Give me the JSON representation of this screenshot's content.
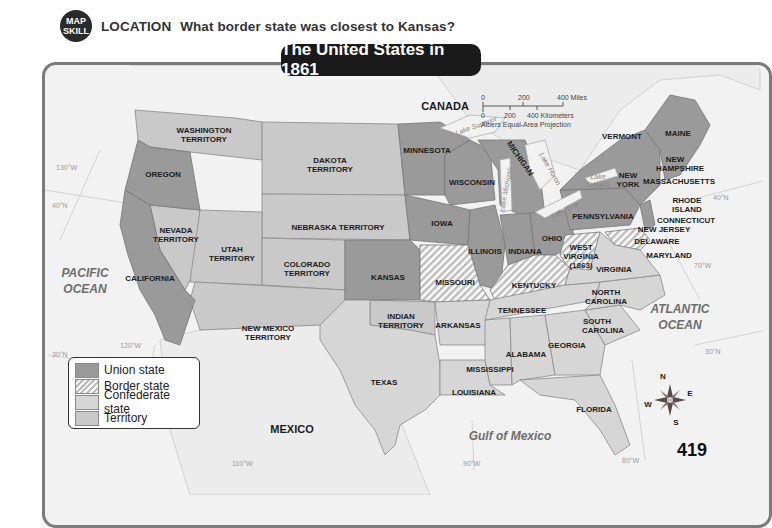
{
  "header": {
    "badge_line1": "MAP",
    "badge_line2": "SKILL",
    "question_keyword": "LOCATION",
    "question_text": "What border state was closest to Kansas?"
  },
  "map": {
    "title": "The United States in 1861",
    "countries": {
      "canada": "CANADA",
      "mexico": "MEXICO"
    },
    "oceans": {
      "pacific_1": "PACIFIC",
      "pacific_2": "OCEAN",
      "atlantic_1": "ATLANTIC",
      "atlantic_2": "OCEAN",
      "gulf": "Gulf of Mexico"
    },
    "lakes": {
      "superior": "Lake Superior",
      "michigan": "Lake Michigan",
      "huron": "Lake Huron",
      "erie": "Lake Erie",
      "ontario_1": "Lake",
      "ontario_2": "Ontario"
    },
    "gridlines": {
      "lon130": "130°W",
      "lon120a": "120°W",
      "lon110": "110°W",
      "lon90": "90°W",
      "lon80": "80°W",
      "lon70": "70°W",
      "lat40w": "40°N",
      "lat30w": "30°N",
      "lat40e": "40°N",
      "lat30e": "30°N"
    },
    "regions": {
      "union": [
        "OREGON",
        "CALIFORNIA",
        "MINNESOTA",
        "WISCONSIN",
        "IOWA",
        "MICHIGAN",
        "ILLINOIS",
        "INDIANA",
        "OHIO",
        "KANSAS",
        "PENNSYLVANIA",
        "NEW YORK",
        "VERMONT",
        "MAINE",
        "NEW HAMPSHIRE",
        "MASSACHUSETTS",
        "RHODE ISLAND",
        "CONNECTICUT",
        "NEW JERSEY",
        "WEST VIRGINIA (1863)"
      ],
      "border": [
        "MISSOURI",
        "KENTUCKY",
        "MARYLAND",
        "DELAWARE"
      ],
      "confederate": [
        "TEXAS",
        "ARKANSAS",
        "LOUISIANA",
        "MISSISSIPPI",
        "ALABAMA",
        "TENNESSEE",
        "GEORGIA",
        "FLORIDA",
        "SOUTH CAROLINA",
        "NORTH CAROLINA",
        "VIRGINIA"
      ],
      "territory": [
        "WASHINGTON TERRITORY",
        "DAKOTA TERRITORY",
        "NEBRASKA TERRITORY",
        "NEVADA TERRITORY",
        "UTAH TERRITORY",
        "COLORADO TERRITORY",
        "NEW MEXICO TERRITORY",
        "INDIAN TERRITORY"
      ]
    },
    "labels": {
      "washington_1": "WASHINGTON",
      "washington_2": "TERRITORY",
      "oregon": "OREGON",
      "dakota_1": "DAKOTA",
      "dakota_2": "TERRITORY",
      "minnesota": "MINNESOTA",
      "wisconsin": "WISCONSIN",
      "michigan": "MICHIGAN",
      "iowa": "IOWA",
      "nebraska": "NEBRASKA TERRITORY",
      "nevada_1": "NEVADA",
      "nevada_2": "TERRITORY",
      "utah_1": "UTAH",
      "utah_2": "TERRITORY",
      "colorado_1": "COLORADO",
      "colorado_2": "TERRITORY",
      "california": "CALIFORNIA",
      "kansas": "KANSAS",
      "missouri": "MISSOURI",
      "illinois": "ILLINOIS",
      "indiana": "INDIANA",
      "ohio": "OHIO",
      "kentucky": "KENTUCKY",
      "westvirginia_1": "WEST",
      "westvirginia_2": "VIRGINIA",
      "westvirginia_3": "(1863)",
      "virginia": "VIRGINIA",
      "pennsylvania": "PENNSYLVANIA",
      "newyork_1": "NEW",
      "newyork_2": "YORK",
      "vermont": "VERMONT",
      "maine": "MAINE",
      "newhampshire_1": "NEW",
      "newhampshire_2": "HAMPSHIRE",
      "massachusetts": "MASSACHUSETTS",
      "rhodeisland_1": "RHODE",
      "rhodeisland_2": "ISLAND",
      "connecticut": "CONNECTICUT",
      "newjersey": "NEW JERSEY",
      "delaware": "DELAWARE",
      "maryland": "MARYLAND",
      "newmexico_1": "NEW MEXICO",
      "newmexico_2": "TERRITORY",
      "indian_1": "INDIAN",
      "indian_2": "TERRITORY",
      "arkansas": "ARKANSAS",
      "tennessee": "TENNESSEE",
      "northcarolina_1": "NORTH",
      "northcarolina_2": "CAROLINA",
      "southcarolina_1": "SOUTH",
      "southcarolina_2": "CAROLINA",
      "georgia": "GEORGIA",
      "alabama": "ALABAMA",
      "mississippi": "MISSISSIPPI",
      "louisiana": "LOUISIANA",
      "texas": "TEXAS",
      "florida": "FLORIDA"
    },
    "scale": {
      "miles_0": "0",
      "miles_200": "200",
      "miles_400": "400 Miles",
      "km_0": "0",
      "km_200": "200",
      "km_400": "400 Kilometers",
      "projection": "Albers Equal-Area Projection"
    },
    "compass": {
      "n": "N",
      "s": "S",
      "e": "E",
      "w": "W"
    },
    "colors": {
      "union": "#9a9a9a",
      "border_hatch": "#bdbdbd",
      "confederate": "#d6d6d6",
      "territory": "#c9c9c9",
      "water": "#f2f2f2",
      "title_bg": "#1a1a1a"
    }
  },
  "legend": {
    "items": [
      {
        "key": "union",
        "label": "Union state"
      },
      {
        "key": "border",
        "label": "Border state"
      },
      {
        "key": "confederate",
        "label": "Confederate state"
      },
      {
        "key": "territory",
        "label": "Territory"
      }
    ]
  },
  "page_number": "419"
}
